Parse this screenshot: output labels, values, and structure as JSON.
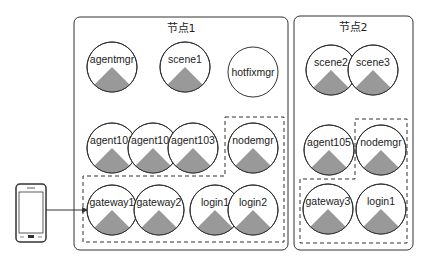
{
  "colors": {
    "stroke": "#333333",
    "wedge": "#999999",
    "background": "#ffffff"
  },
  "client": {
    "icon": "mobile-phone-icon",
    "arrow_target": "gateway1"
  },
  "nodes": [
    {
      "title": "节点1",
      "services": [
        {
          "label": "agentmgr",
          "wedge": true
        },
        {
          "label": "scene1",
          "wedge": true
        },
        {
          "label": "hotfixmgr",
          "wedge": false
        },
        {
          "label": "agent101",
          "wedge": true
        },
        {
          "label": "agent102",
          "wedge": true
        },
        {
          "label": "agent103",
          "wedge": true
        },
        {
          "label": "nodemgr",
          "wedge": true
        },
        {
          "label": "gateway1",
          "wedge": true
        },
        {
          "label": "gateway2",
          "wedge": true
        },
        {
          "label": "login1",
          "wedge": true
        },
        {
          "label": "login2",
          "wedge": true
        }
      ]
    },
    {
      "title": "节点2",
      "services": [
        {
          "label": "scene2",
          "wedge": true
        },
        {
          "label": "scene3",
          "wedge": true
        },
        {
          "label": "agent105",
          "wedge": true
        },
        {
          "label": "nodemgr",
          "wedge": true
        },
        {
          "label": "gateway3",
          "wedge": true
        },
        {
          "label": "login1",
          "wedge": true
        }
      ]
    }
  ]
}
